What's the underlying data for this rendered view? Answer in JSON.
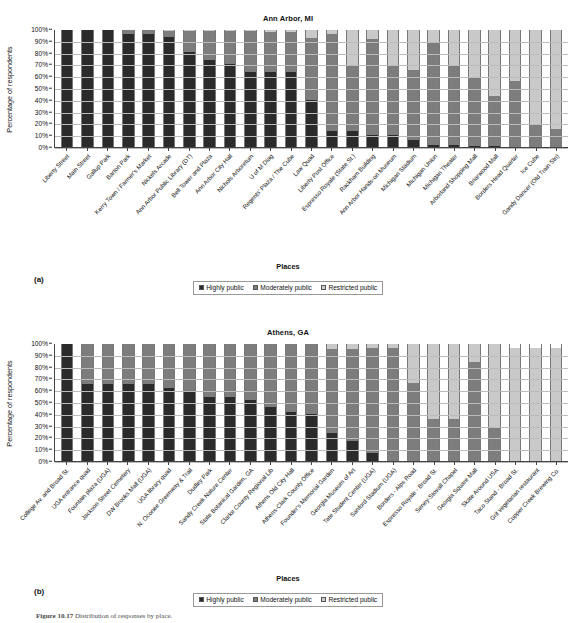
{
  "figure": {
    "caption_label": "Figure 10.17",
    "caption_text": "Distribution of responses by place."
  },
  "legend": {
    "title": "Places",
    "items": [
      {
        "label": "Highly public",
        "color": "#2b2b2b"
      },
      {
        "label": "Moderately public",
        "color": "#7d7d7d"
      },
      {
        "label": "Restricted public",
        "color": "#d0d0d0"
      }
    ]
  },
  "panels": [
    {
      "letter": "(a)"
    },
    {
      "letter": "(b)"
    }
  ],
  "axis": {
    "ylabel": "Percentage of respondents",
    "xlabel": "Places",
    "yticks": [
      "100%",
      "90%",
      "80%",
      "70%",
      "60%",
      "50%",
      "40%",
      "30%",
      "20%",
      "10%",
      "0%"
    ]
  },
  "chart_data": [
    {
      "type": "bar",
      "stacked": true,
      "normalized": true,
      "title": "Ann Arbor, MI",
      "xlabel": "Places",
      "ylabel": "Percentage of respondents",
      "ylim": [
        0,
        100
      ],
      "grid": true,
      "legend_position": "bottom",
      "categories": [
        "Liberty Street",
        "Main Street",
        "Gallup Park",
        "Barton Park",
        "Kerry Town / Farmer's Market",
        "Nickels Arcade",
        "Ann Arbor Public Library (DT)",
        "Bell Tower and Plaza",
        "Ann Arbor City Hall",
        "Nichols Arboretum",
        "U of M Diag",
        "Regents' Plaza / The Cube",
        "Law Quad",
        "Liberty Post Office",
        "Espresso Royale (State St.)",
        "Rackham Building",
        "Ann Arbor Hands-on Museum",
        "Michigan Stadium",
        "Michigan Union",
        "Michigan Theater",
        "Arborland Shopping Mall",
        "Briarwood Mall",
        "Borders Head Quarter",
        "Ice Cube",
        "Gandy Dancer (Old Train Stn)"
      ],
      "series": [
        {
          "name": "Highly public",
          "color": "#2b2b2b",
          "values": [
            100,
            100,
            100,
            97,
            97,
            94,
            81,
            74,
            71,
            64,
            64,
            64,
            40,
            14,
            14,
            10,
            10,
            6,
            2,
            2,
            1,
            1,
            0,
            0,
            0
          ]
        },
        {
          "name": "Moderately public",
          "color": "#7d7d7d",
          "values": [
            0,
            0,
            0,
            3,
            3,
            5,
            18,
            25,
            28,
            35,
            34,
            34,
            53,
            83,
            56,
            82,
            59,
            60,
            87,
            67,
            58,
            43,
            56,
            19,
            15
          ]
        },
        {
          "name": "Restricted public",
          "color": "#c9c9c9",
          "values": [
            0,
            0,
            0,
            0,
            0,
            1,
            1,
            1,
            1,
            1,
            2,
            2,
            7,
            3,
            30,
            8,
            31,
            34,
            11,
            31,
            41,
            56,
            44,
            81,
            85
          ]
        }
      ]
    },
    {
      "type": "bar",
      "stacked": true,
      "normalized": true,
      "title": "Athens, GA",
      "xlabel": "Places",
      "ylabel": "Percentage of respondents",
      "ylim": [
        0,
        100
      ],
      "grid": true,
      "legend_position": "bottom",
      "categories": [
        "College Av. and Broad St.",
        "UGA entrance quad",
        "Fountain plaza (UGA)",
        "Jackson Street Cemetery",
        "DW Brooks Mall (UGA)",
        "UGA library quad",
        "N. Oconee Greenway & Trail",
        "Dudley Park",
        "Sandy Creek Nature Center",
        "State Botanical Garden, GA",
        "Clarke County Regional Lib",
        "Athens Old City Hall",
        "Athens-Clark County Office",
        "Founder's Memorial Garden",
        "Georgia Museum of Art",
        "Tate Student Center (UGA)",
        "Sanford Stadium (UGA)",
        "Borders - Alps Road",
        "Espresso Royale - Broad St.",
        "Seney-Stovall Chapel",
        "Georgia Square Mall",
        "Skate Around USA",
        "Taco Stand - Broad St.",
        "Grit vegetarian restaurant",
        "Copper Creek Brewing Co."
      ],
      "series": [
        {
          "name": "Highly public",
          "color": "#2b2b2b",
          "values": [
            100,
            66,
            66,
            66,
            66,
            62,
            59,
            55,
            55,
            52,
            46,
            42,
            40,
            24,
            17,
            7,
            0,
            0,
            0,
            0,
            0,
            0,
            0,
            0,
            0
          ]
        },
        {
          "name": "Moderately public",
          "color": "#7d7d7d",
          "values": [
            0,
            34,
            34,
            34,
            34,
            38,
            41,
            45,
            45,
            48,
            54,
            58,
            60,
            72,
            79,
            90,
            97,
            67,
            36,
            36,
            85,
            29,
            0,
            0,
            0
          ]
        },
        {
          "name": "Restricted public",
          "color": "#c9c9c9",
          "values": [
            0,
            0,
            0,
            0,
            0,
            0,
            0,
            0,
            0,
            0,
            0,
            0,
            0,
            4,
            4,
            3,
            3,
            33,
            64,
            64,
            15,
            71,
            97,
            97,
            97
          ]
        }
      ]
    }
  ]
}
